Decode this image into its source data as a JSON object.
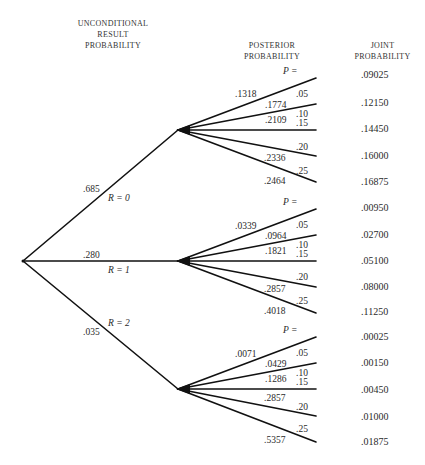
{
  "headers": {
    "unconditional": [
      "UNCONDITIONAL",
      "RESULT",
      "PROBABILITY"
    ],
    "posterior": [
      "POSTERIOR",
      "PROBABILITY"
    ],
    "joint": [
      "JOINT",
      "PROBABILITY"
    ]
  },
  "p_label": "P =",
  "results": [
    {
      "label": "R = 0",
      "prob": ".685",
      "branches": [
        {
          "p": ".05",
          "posterior": ".1318",
          "joint": ".09025"
        },
        {
          "p": ".10",
          "posterior": ".1774",
          "joint": ".12150"
        },
        {
          "p": ".15",
          "posterior": ".2109",
          "joint": ".14450"
        },
        {
          "p": ".20",
          "posterior": ".2336",
          "joint": ".16000"
        },
        {
          "p": ".25",
          "posterior": ".2464",
          "joint": ".16875"
        }
      ]
    },
    {
      "label": "R = 1",
      "prob": ".280",
      "branches": [
        {
          "p": ".05",
          "posterior": ".0339",
          "joint": ".00950"
        },
        {
          "p": ".10",
          "posterior": ".0964",
          "joint": ".02700"
        },
        {
          "p": ".15",
          "posterior": ".1821",
          "joint": ".05100"
        },
        {
          "p": ".20",
          "posterior": ".2857",
          "joint": ".08000"
        },
        {
          "p": ".25",
          "posterior": ".4018",
          "joint": ".11250"
        }
      ]
    },
    {
      "label": "R = 2",
      "prob": ".035",
      "branches": [
        {
          "p": ".05",
          "posterior": ".0071",
          "joint": ".00025"
        },
        {
          "p": ".10",
          "posterior": ".0429",
          "joint": ".00150"
        },
        {
          "p": ".15",
          "posterior": ".1286",
          "joint": ".00450"
        },
        {
          "p": ".20",
          "posterior": ".2857",
          "joint": ".01000"
        },
        {
          "p": ".25",
          "posterior": ".5357",
          "joint": ".01875"
        }
      ]
    }
  ],
  "colors": {
    "line": "#111111",
    "text": "#2a2a2a",
    "background": "#ffffff"
  }
}
